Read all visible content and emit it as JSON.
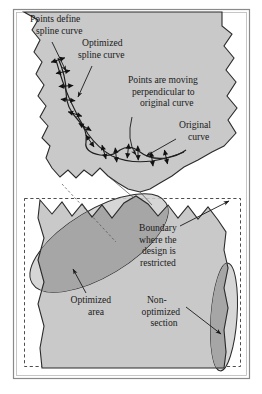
{
  "figure": {
    "colors": {
      "frame": "#8a8a8a",
      "part_fill": "#c9c9c9",
      "overlap_fill": "#a6a6a6",
      "ellipse_fill": "#cfcfcf",
      "outline": "#2b2b2b",
      "dashed_boundary": "#3a3a3a",
      "text": "#1a1a1a",
      "background": "#ffffff"
    },
    "labels": [
      {
        "id": "points-define-spline-curve",
        "lines": [
          "Points define",
          "spline curve"
        ],
        "x": 30,
        "y": 22,
        "align": "left",
        "leader": "M 52 42 L 66 71"
      },
      {
        "id": "optimized-spline-curve",
        "lines": [
          "Optimized",
          "spline curve"
        ],
        "x": 78,
        "y": 46,
        "align": "left",
        "leader": "M 92 66 L 78 97"
      },
      {
        "id": "points-are-moving-perpendicular",
        "lines": [
          "Points are moving",
          "perpendicular to",
          "original curve"
        ],
        "x": 128,
        "y": 83,
        "align": "left",
        "leader": "M 132 117 Q 126 140 136 155"
      },
      {
        "id": "original-curve",
        "lines": [
          "Original",
          "curve"
        ],
        "x": 179,
        "y": 128,
        "align": "left",
        "leader": "M 176 139 L 146 156"
      },
      {
        "id": "boundary-where-design-is-restricted",
        "lines": [
          "Boundary",
          "where the",
          "design is",
          "restricted"
        ],
        "x": 139,
        "y": 231,
        "align": "left",
        "leader": "M 180 226 L 229 201"
      },
      {
        "id": "optimized-area",
        "lines": [
          "Optimized",
          "area"
        ],
        "x": 92,
        "y": 303,
        "align": "middle",
        "leader": "M 86 293 L 73 269"
      },
      {
        "id": "non-optimized-section",
        "lines": [
          "Non-",
          "optimized",
          "section"
        ],
        "x": 162,
        "y": 303,
        "align": "middle",
        "leader": "M 186 307 L 221 334"
      }
    ],
    "arrow_markers": {
      "name": "double-headed-perpendicular-arrows",
      "count": 13,
      "description": "Double-headed arrows perpendicular to the original curve indicating point movement direction"
    },
    "shapes": {
      "upper_part": "gear-tooth-shaped workpiece cross-section, jagged lower-left and right edges",
      "lower_part": "gear-tooth-shaped workpiece cross-section with serrated upper edge",
      "dashed_rect": "design restriction boundary rectangle",
      "ellipse_left": "rotated ellipse marking optimized area",
      "ellipse_right": "narrow vertical ellipse marking non-optimized section"
    }
  }
}
